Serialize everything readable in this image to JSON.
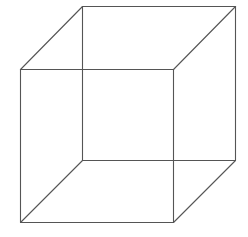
{
  "diagram": {
    "type": "wireframe-cube",
    "stroke_color": "#555555",
    "stroke_width": 1.1,
    "background": "#ffffff",
    "vertices": {
      "back_top_left": [
        82,
        6
      ],
      "back_top_right": [
        235,
        6
      ],
      "back_bottom_right": [
        235,
        160
      ],
      "back_bottom_left": [
        82,
        160
      ],
      "front_top_left": [
        20,
        69
      ],
      "front_top_right": [
        173,
        69
      ],
      "front_bottom_right": [
        173,
        222
      ],
      "front_bottom_left": [
        20,
        222
      ]
    },
    "edges": [
      [
        "back_top_left",
        "back_top_right"
      ],
      [
        "back_top_right",
        "back_bottom_right"
      ],
      [
        "back_bottom_right",
        "back_bottom_left"
      ],
      [
        "back_bottom_left",
        "back_top_left"
      ],
      [
        "front_top_left",
        "front_top_right"
      ],
      [
        "front_top_right",
        "front_bottom_right"
      ],
      [
        "front_bottom_right",
        "front_bottom_left"
      ],
      [
        "front_bottom_left",
        "front_top_left"
      ],
      [
        "front_top_left",
        "back_top_left"
      ],
      [
        "front_top_right",
        "back_top_right"
      ],
      [
        "front_bottom_right",
        "back_bottom_right"
      ],
      [
        "front_bottom_left",
        "back_bottom_left"
      ]
    ]
  }
}
